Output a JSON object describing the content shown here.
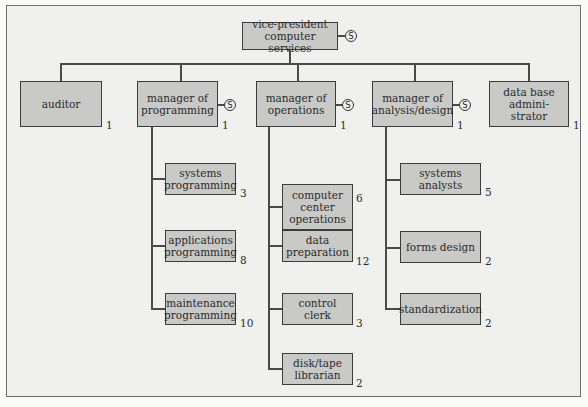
{
  "diagram": {
    "type": "organization-chart",
    "staff_marker": "S",
    "root": {
      "label": "vice-president computer services",
      "line1": "vice-president",
      "line2": "computer services",
      "staff": true
    },
    "level1": [
      {
        "id": "auditor",
        "lines": [
          "auditor"
        ],
        "count": "1",
        "staff": false
      },
      {
        "id": "manager-programming",
        "lines": [
          "manager of",
          "programming"
        ],
        "count": "1",
        "staff": true,
        "children": [
          {
            "lines": [
              "systems",
              "programming"
            ],
            "count": "3"
          },
          {
            "lines": [
              "applications",
              "programming"
            ],
            "count": "8"
          },
          {
            "lines": [
              "maintenance",
              "programming"
            ],
            "count": "10"
          }
        ]
      },
      {
        "id": "manager-operations",
        "lines": [
          "manager of",
          "operations"
        ],
        "count": "1",
        "staff": true,
        "children": [
          {
            "lines": [
              "computer",
              "center",
              "operations"
            ],
            "count": "6"
          },
          {
            "lines": [
              "data",
              "preparation"
            ],
            "count": "12"
          },
          {
            "lines": [
              "control",
              "clerk"
            ],
            "count": "3"
          },
          {
            "lines": [
              "disk/tape",
              "librarian"
            ],
            "count": "2"
          }
        ]
      },
      {
        "id": "manager-analysis",
        "lines": [
          "manager of",
          "analysis/design"
        ],
        "count": "1",
        "staff": true,
        "children": [
          {
            "lines": [
              "systems",
              "analysts"
            ],
            "count": "5"
          },
          {
            "lines": [
              "forms design"
            ],
            "count": "2"
          },
          {
            "lines": [
              "standardization"
            ],
            "count": "2"
          }
        ]
      },
      {
        "id": "dba",
        "lines": [
          "data base",
          "admini-",
          "strator"
        ],
        "count": "1",
        "staff": false
      }
    ]
  }
}
